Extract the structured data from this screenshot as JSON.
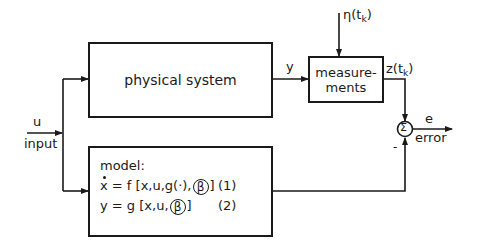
{
  "diagram": {
    "type": "block-diagram",
    "title": "",
    "blocks": {
      "physical_system": {
        "label": "physical system"
      },
      "measurements": {
        "label_line1": "measure-",
        "label_line2": "ments"
      },
      "model": {
        "title": "model:",
        "equation1": {
          "lhs": "x",
          "rhs_pre": "= f [x,u,g(·),",
          "param": "β",
          "rhs_post": "]",
          "number": "(1)"
        },
        "equation2": {
          "lhs": "y",
          "rhs_pre": "= g [x,u,",
          "param": "β",
          "rhs_post": "]",
          "number": "(2)"
        }
      },
      "summing_junction": {
        "symbol": "Σ",
        "minus_sign": "-"
      }
    },
    "signals": {
      "input_symbol": "u",
      "input_label": "input",
      "output_y": "y",
      "noise": {
        "symbol": "η",
        "arg_pre": "(t",
        "arg_sub": "k",
        "arg_post": ")"
      },
      "measured": {
        "symbol": "z",
        "arg_pre": "(t",
        "arg_sub": "k",
        "arg_post": ")"
      },
      "error_symbol": "e",
      "error_label": "error"
    },
    "colors": {
      "line": "#1a1a1a",
      "background": "#ffffff"
    },
    "nodes": [
      "input u",
      "physical system",
      "measurements",
      "model",
      "summing junction Σ",
      "error e"
    ],
    "edges": [
      {
        "from": "input u",
        "to": "physical system"
      },
      {
        "from": "input u",
        "to": "model"
      },
      {
        "from": "physical system",
        "to": "measurements",
        "label": "y"
      },
      {
        "from": "noise η(t_k)",
        "to": "measurements"
      },
      {
        "from": "measurements",
        "to": "summing junction Σ",
        "label": "z(t_k)",
        "sign": "+"
      },
      {
        "from": "model",
        "to": "summing junction Σ",
        "sign": "-"
      },
      {
        "from": "summing junction Σ",
        "to": "error e",
        "label": "e / error"
      }
    ]
  }
}
